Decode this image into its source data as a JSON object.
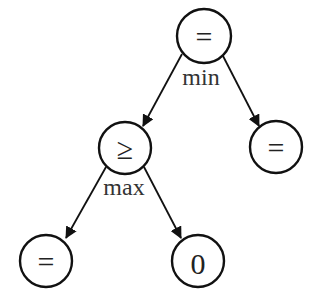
{
  "diagram": {
    "type": "tree",
    "nodes": [
      {
        "id": "root",
        "label": "=",
        "cx": 204,
        "cy": 36
      },
      {
        "id": "ge",
        "label": "≥",
        "cx": 125,
        "cy": 148
      },
      {
        "id": "right_eq",
        "label": "=",
        "cx": 276,
        "cy": 147
      },
      {
        "id": "bl_eq",
        "label": "=",
        "cx": 46,
        "cy": 261
      },
      {
        "id": "zero",
        "label": "0",
        "cx": 198,
        "cy": 261
      }
    ],
    "edges": [
      {
        "from": "root",
        "to": "ge"
      },
      {
        "from": "root",
        "to": "right_eq"
      },
      {
        "from": "ge",
        "to": "bl_eq"
      },
      {
        "from": "ge",
        "to": "zero"
      }
    ],
    "operator_labels": [
      {
        "node": "root",
        "label": "min"
      },
      {
        "node": "ge",
        "label": "max"
      }
    ]
  },
  "colors": {
    "stroke": "#111111",
    "text": "#222222",
    "background": "#ffffff"
  }
}
